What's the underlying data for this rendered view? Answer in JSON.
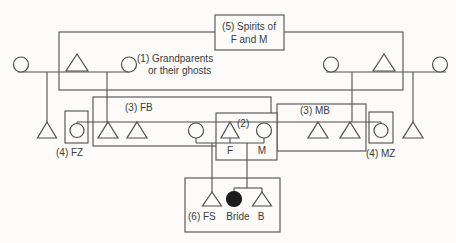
{
  "figure": {
    "type": "kinship-diagram",
    "width": 456,
    "height": 243,
    "colors": {
      "background": "#fcfbf9",
      "stroke": "#4f4f4f",
      "text": "#3b3b3b",
      "bride_fill": "#1c1c1c"
    },
    "rects": [
      {
        "name": "group-fathers-brothers-rect",
        "x": 93,
        "y": 97,
        "w": 178,
        "h": 49,
        "fill": "none"
      },
      {
        "name": "group-mothers-brothers-rect",
        "x": 277,
        "y": 104,
        "w": 89,
        "h": 47,
        "fill": "none"
      },
      {
        "name": "group-parents-box",
        "x": 216,
        "y": 113,
        "w": 61,
        "h": 47,
        "fill": "bg"
      },
      {
        "name": "group-grandparents-rect",
        "x": 59,
        "y": 32,
        "w": 344,
        "h": 58,
        "fill": "none"
      },
      {
        "name": "spirits-box",
        "x": 215,
        "y": 15,
        "w": 69,
        "h": 35,
        "fill": "bg"
      },
      {
        "name": "group-fathers-sister-box",
        "x": 65,
        "y": 111,
        "w": 23,
        "h": 32,
        "fill": "none"
      },
      {
        "name": "group-mothers-sister-box",
        "x": 369,
        "y": 112,
        "w": 24,
        "h": 31,
        "fill": "none"
      },
      {
        "name": "group-children-box",
        "x": 185,
        "y": 178,
        "w": 95,
        "h": 54,
        "fill": "none"
      }
    ],
    "lines": [
      {
        "name": "marriage-line-grandparents-left",
        "x1": 18,
        "y1": 72,
        "x2": 130,
        "y2": 72
      },
      {
        "name": "marriage-line-grandparents-right",
        "x1": 326,
        "y1": 72,
        "x2": 446,
        "y2": 72
      },
      {
        "name": "descent-line-left-outer",
        "x1": 47,
        "y1": 72,
        "x2": 47,
        "y2": 122
      },
      {
        "name": "descent-line-left-inner",
        "x1": 107,
        "y1": 72,
        "x2": 107,
        "y2": 122
      },
      {
        "name": "descent-line-right-inner",
        "x1": 352,
        "y1": 72,
        "x2": 352,
        "y2": 122
      },
      {
        "name": "descent-line-right-outer",
        "x1": 413,
        "y1": 72,
        "x2": 413,
        "y2": 122
      },
      {
        "name": "sibling-line-parents-generation",
        "x1": 77,
        "y1": 122,
        "x2": 381,
        "y2": 122
      },
      {
        "name": "stub-fathers-sister",
        "x1": 77,
        "y1": 122,
        "x2": 77,
        "y2": 124
      },
      {
        "name": "stub-mothers-sister",
        "x1": 381,
        "y1": 122,
        "x2": 381,
        "y2": 124
      },
      {
        "name": "stub-fathers-other-wife",
        "x1": 196,
        "y1": 138,
        "x2": 196,
        "y2": 143
      },
      {
        "name": "marriage-line-parents",
        "x1": 196,
        "y1": 143,
        "x2": 264,
        "y2": 143
      },
      {
        "name": "stub-father",
        "x1": 230,
        "y1": 138,
        "x2": 230,
        "y2": 143
      },
      {
        "name": "stub-mother",
        "x1": 264,
        "y1": 138,
        "x2": 264,
        "y2": 143
      },
      {
        "name": "descent-line-fathers-son",
        "x1": 212,
        "y1": 143,
        "x2": 212,
        "y2": 192
      },
      {
        "name": "descent-line-children",
        "x1": 247,
        "y1": 143,
        "x2": 247,
        "y2": 188
      },
      {
        "name": "sibling-line-children",
        "x1": 234,
        "y1": 188,
        "x2": 262,
        "y2": 188
      },
      {
        "name": "stub-bride",
        "x1": 234,
        "y1": 188,
        "x2": 234,
        "y2": 192
      },
      {
        "name": "stub-brother",
        "x1": 262,
        "y1": 188,
        "x2": 262,
        "y2": 192
      }
    ],
    "triangles": [
      {
        "name": "grandfather-left-triangle",
        "cx": 77,
        "apex": 54,
        "base": 71,
        "hw": 11
      },
      {
        "name": "grandfather-right-triangle",
        "cx": 384,
        "apex": 54,
        "base": 71,
        "hw": 11
      },
      {
        "name": "half-uncle-left-triangle",
        "cx": 47,
        "apex": 122,
        "base": 138,
        "hw": 9.5
      },
      {
        "name": "fathers-brother-1-triangle",
        "cx": 108,
        "apex": 122,
        "base": 138,
        "hw": 10
      },
      {
        "name": "fathers-brother-2-triangle",
        "cx": 137,
        "apex": 122,
        "base": 138,
        "hw": 10
      },
      {
        "name": "father-triangle",
        "cx": 230,
        "apex": 122,
        "base": 138,
        "hw": 9
      },
      {
        "name": "mothers-brother-1-triangle",
        "cx": 318,
        "apex": 122,
        "base": 138,
        "hw": 10
      },
      {
        "name": "mothers-brother-2-triangle",
        "cx": 350,
        "apex": 122,
        "base": 138,
        "hw": 10
      },
      {
        "name": "half-uncle-right-triangle",
        "cx": 413,
        "apex": 122,
        "base": 138,
        "hw": 10
      },
      {
        "name": "fathers-son-triangle",
        "cx": 212,
        "apex": 192,
        "base": 206,
        "hw": 9.5
      },
      {
        "name": "brother-triangle",
        "cx": 262,
        "apex": 192,
        "base": 206,
        "hw": 9.5
      }
    ],
    "circles": [
      {
        "name": "grandmother-outer-left-circle",
        "cx": 21,
        "cy": 64.5,
        "r": 7.5,
        "filled": false
      },
      {
        "name": "grandmother-inner-left-circle",
        "cx": 129,
        "cy": 64.5,
        "r": 7.5,
        "filled": false
      },
      {
        "name": "grandmother-inner-right-circle",
        "cx": 331,
        "cy": 64.5,
        "r": 7.5,
        "filled": false
      },
      {
        "name": "grandmother-outer-right-circle",
        "cx": 440,
        "cy": 64.5,
        "r": 7.5,
        "filled": false
      },
      {
        "name": "fathers-sister-circle",
        "cx": 77,
        "cy": 130.5,
        "r": 7,
        "filled": false
      },
      {
        "name": "fathers-other-wife-circle",
        "cx": 196,
        "cy": 130.5,
        "r": 7.5,
        "filled": false
      },
      {
        "name": "mother-circle",
        "cx": 264,
        "cy": 130.5,
        "r": 7.5,
        "filled": false
      },
      {
        "name": "mothers-sister-circle",
        "cx": 381,
        "cy": 130.5,
        "r": 7,
        "filled": false
      },
      {
        "name": "bride-circle",
        "cx": 234,
        "cy": 199,
        "r": 7.5,
        "filled": true
      }
    ],
    "labels": [
      {
        "name": "label-spirits-line1",
        "text": "(5) Spirits of",
        "x": 249,
        "y": 30,
        "anchor": "middle"
      },
      {
        "name": "label-spirits-line2",
        "text": "F and M",
        "x": 249,
        "y": 43,
        "anchor": "middle"
      },
      {
        "name": "label-grandparents-line1",
        "text": "(1) Grandparents",
        "x": 137,
        "y": 62,
        "anchor": "start"
      },
      {
        "name": "label-grandparents-line2",
        "text": "or their ghosts",
        "x": 148,
        "y": 74,
        "anchor": "start"
      },
      {
        "name": "label-fathers-brothers",
        "text": "(3) FB",
        "x": 125,
        "y": 111,
        "anchor": "start"
      },
      {
        "name": "label-mothers-brothers",
        "text": "(3) MB",
        "x": 300,
        "y": 114,
        "anchor": "start"
      },
      {
        "name": "label-parents-number",
        "text": "(2)",
        "x": 237,
        "y": 127,
        "anchor": "start"
      },
      {
        "name": "label-father",
        "text": "F",
        "x": 230,
        "y": 154,
        "anchor": "middle"
      },
      {
        "name": "label-mother",
        "text": "M",
        "x": 262,
        "y": 154,
        "anchor": "middle"
      },
      {
        "name": "label-fathers-sister",
        "text": "(4) FZ",
        "x": 56,
        "y": 156,
        "anchor": "start"
      },
      {
        "name": "label-mothers-sister",
        "text": "(4) MZ",
        "x": 366,
        "y": 157,
        "anchor": "start"
      },
      {
        "name": "label-fathers-son",
        "text": "(6) FS",
        "x": 188,
        "y": 220,
        "anchor": "start"
      },
      {
        "name": "label-bride",
        "text": "Bride",
        "x": 238,
        "y": 220,
        "anchor": "middle"
      },
      {
        "name": "label-brother",
        "text": "B",
        "x": 261,
        "y": 220,
        "anchor": "middle"
      }
    ]
  }
}
